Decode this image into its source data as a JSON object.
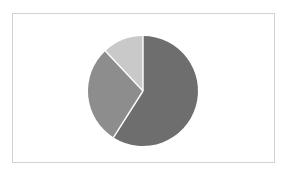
{
  "figure": {
    "width": 288,
    "height": 177,
    "background_color": "#ffffff",
    "frame": {
      "border_color": "#d2d2d2",
      "background_color": "#ffffff",
      "x": 12,
      "y": 13,
      "width": 263,
      "height": 150
    }
  },
  "chart_data": {
    "type": "pie",
    "title": "",
    "subtitle": "",
    "xlabel": "",
    "ylabel": "",
    "grid": false,
    "legend": false,
    "legend_position": "none",
    "labels_shown": false,
    "annotations": [],
    "tick_labels": [],
    "center": {
      "cx": 143,
      "cy": 91
    },
    "radius": 55,
    "start_angle_deg": 0,
    "direction": "clockwise",
    "slice_separator_color": "#ffffff",
    "slice_separator_width": 1.4,
    "labels": [
      "Slice 1",
      "Slice 2",
      "Slice 3"
    ],
    "values": [
      59,
      29,
      12
    ],
    "percentages": [
      "59%",
      "29%",
      "12%"
    ],
    "colors": [
      "#6e6e6e",
      "#8d8d8d",
      "#c9c9c9"
    ],
    "slices": [
      {
        "name": "Slice 1",
        "value": 59,
        "percent": "59%",
        "color": "#6e6e6e",
        "start_angle_deg": 0,
        "end_angle_deg": 212.4
      },
      {
        "name": "Slice 2",
        "value": 29,
        "percent": "29%",
        "color": "#8d8d8d",
        "start_angle_deg": 212.4,
        "end_angle_deg": 316.8
      },
      {
        "name": "Slice 3",
        "value": 12,
        "percent": "12%",
        "color": "#c9c9c9",
        "start_angle_deg": 316.8,
        "end_angle_deg": 360
      }
    ]
  }
}
